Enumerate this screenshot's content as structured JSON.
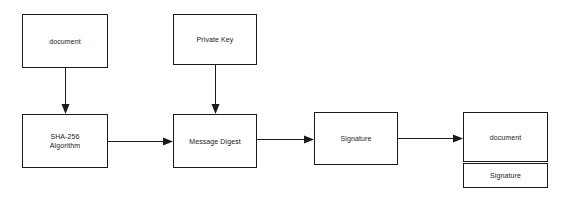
{
  "diagram": {
    "type": "flowchart",
    "background_color": "#ffffff",
    "stroke_color": "#1a1a1a",
    "fill_color": "#ffffff",
    "nodes": [
      {
        "id": "document_input",
        "label": "document"
      },
      {
        "id": "private_key",
        "label": "Private Key"
      },
      {
        "id": "sha256",
        "label": "SHA-256\nAlgorithm"
      },
      {
        "id": "message_digest",
        "label": "Message Digest"
      },
      {
        "id": "signature",
        "label": "Signature"
      },
      {
        "id": "signed_document_body",
        "label": "document"
      },
      {
        "id": "signed_document_signature",
        "label": "Signature"
      }
    ],
    "edges": [
      {
        "from": "document_input",
        "to": "sha256",
        "direction": "down"
      },
      {
        "from": "private_key",
        "to": "message_digest",
        "direction": "down"
      },
      {
        "from": "sha256",
        "to": "message_digest",
        "direction": "right"
      },
      {
        "from": "message_digest",
        "to": "signature",
        "direction": "right"
      },
      {
        "from": "signature",
        "to": "signed_document_body",
        "direction": "right"
      }
    ]
  }
}
